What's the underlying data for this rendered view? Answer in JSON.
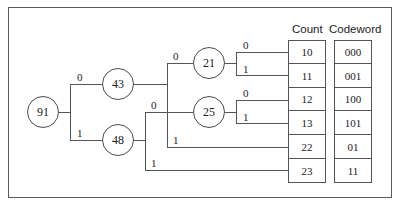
{
  "tree": {
    "nodes": [
      {
        "id": "n91",
        "value": "91"
      },
      {
        "id": "n43",
        "value": "43"
      },
      {
        "id": "n48",
        "value": "48"
      },
      {
        "id": "n21",
        "value": "21"
      },
      {
        "id": "n25",
        "value": "25"
      }
    ],
    "branch_labels": {
      "n91_0": "0",
      "n91_1": "1",
      "n43_0": "0",
      "n43_1": "1",
      "n48_0": "0",
      "n48_1": "1",
      "n21_0": "0",
      "n21_1": "1",
      "n25_0": "0",
      "n25_1": "1"
    }
  },
  "table": {
    "count_header": "Count",
    "codeword_header": "Codeword",
    "rows": [
      {
        "count": "10",
        "codeword": "000"
      },
      {
        "count": "11",
        "codeword": "001"
      },
      {
        "count": "12",
        "codeword": "100"
      },
      {
        "count": "13",
        "codeword": "101"
      },
      {
        "count": "22",
        "codeword": "01"
      },
      {
        "count": "23",
        "codeword": "11"
      }
    ]
  }
}
